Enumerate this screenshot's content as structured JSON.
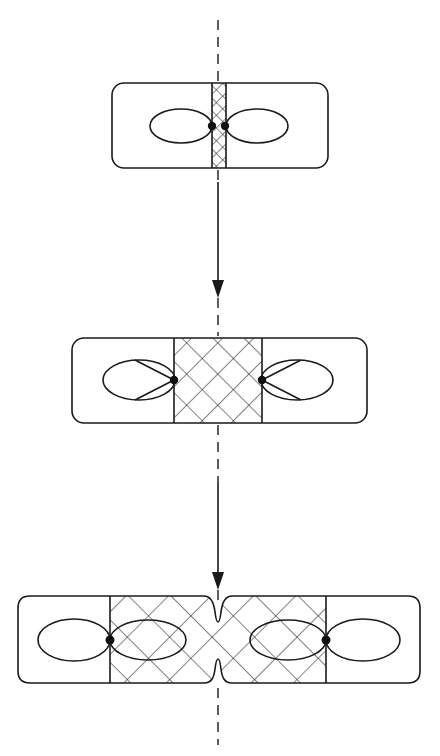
{
  "diagram": {
    "description": "Three-stage schematic of a rectangular cell with paired lobes and a cross-hatched central region that widens and then pinches at the dashed midline",
    "axis": {
      "type": "dashed-vertical-line",
      "x": 218
    },
    "stages": [
      {
        "label": "stage-1",
        "hatched_region": "narrow central strip",
        "dots": 2
      },
      {
        "label": "stage-2",
        "hatched_region": "wide central square",
        "dots": 2
      },
      {
        "label": "stage-3",
        "hatched_region": "expanded region with central constriction",
        "dots": 2
      }
    ],
    "arrows": [
      {
        "from": "stage-1",
        "to": "stage-2",
        "direction": "down"
      },
      {
        "from": "stage-2",
        "to": "stage-3",
        "direction": "down"
      }
    ],
    "colors": {
      "line": "#1a1a1a",
      "background": "#ffffff"
    }
  }
}
